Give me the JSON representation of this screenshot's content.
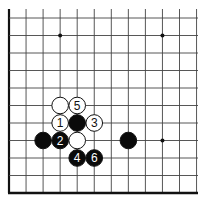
{
  "board": {
    "description": "Go board corner diagram (lower-left corner)",
    "columns": 11,
    "rows": 11,
    "grid_color": "#444444",
    "border_color": "#111111",
    "star_points": [
      {
        "col": 3,
        "row": 1
      },
      {
        "col": 9,
        "row": 1
      },
      {
        "col": 9,
        "row": 7
      }
    ]
  },
  "stones": [
    {
      "color": "white",
      "col": 3,
      "row": 5,
      "label": ""
    },
    {
      "color": "white",
      "col": 4,
      "row": 5,
      "label": "5"
    },
    {
      "color": "white",
      "col": 3,
      "row": 6,
      "label": "1"
    },
    {
      "color": "black",
      "col": 4,
      "row": 6,
      "label": ""
    },
    {
      "color": "white",
      "col": 5,
      "row": 6,
      "label": "3"
    },
    {
      "color": "black",
      "col": 2,
      "row": 7,
      "label": ""
    },
    {
      "color": "black",
      "col": 3,
      "row": 7,
      "label": "2"
    },
    {
      "color": "white",
      "col": 4,
      "row": 7,
      "label": ""
    },
    {
      "color": "black",
      "col": 7,
      "row": 7,
      "label": ""
    },
    {
      "color": "black",
      "col": 4,
      "row": 8,
      "label": "4"
    },
    {
      "color": "black",
      "col": 5,
      "row": 8,
      "label": "6"
    }
  ]
}
